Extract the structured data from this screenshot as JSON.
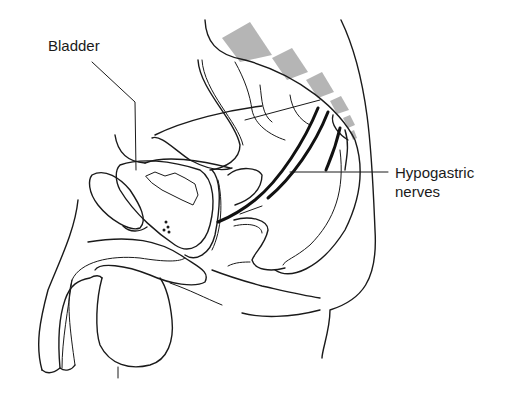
{
  "figure": {
    "type": "anatomical line drawing",
    "colors": {
      "line": "#1a1a1a",
      "vertebrae_fill": "#b5b5b5",
      "background": "#ffffff"
    }
  },
  "labels": {
    "bladder": "Bladder",
    "hypogastric_line1": "Hypogastric",
    "hypogastric_line2": "nerves"
  }
}
